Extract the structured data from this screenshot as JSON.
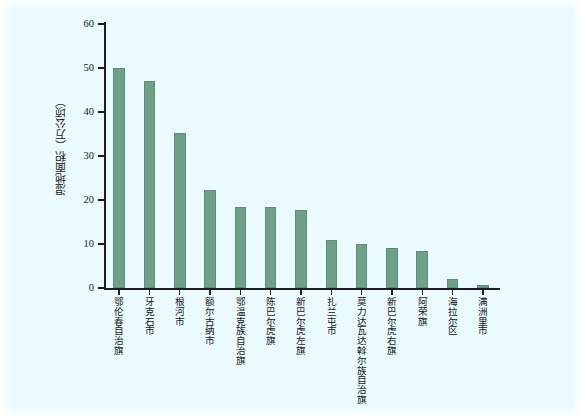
{
  "figure": {
    "background_color": "#eafafd",
    "bar_color": "#6fa188",
    "axis_color": "#1d1d1d"
  },
  "chart_data": {
    "type": "bar",
    "title": "",
    "xlabel": "",
    "ylabel": "湿地面积（万公顷）",
    "ylim": [
      0,
      60
    ],
    "yticks": [
      0,
      10,
      20,
      30,
      40,
      50,
      60
    ],
    "grid": false,
    "legend": null,
    "categories": [
      "鄂伦春自治旗",
      "牙克石市",
      "根河市",
      "额尔古纳市",
      "鄂温克族自治旗",
      "陈巴尔虎旗",
      "新巴尔虎左旗",
      "扎兰屯市",
      "莫力达瓦达斡尔族自治旗",
      "新巴尔虎右旗",
      "阿荣旗",
      "海拉尔区",
      "满洲里市"
    ],
    "values": [
      50.0,
      47.0,
      35.3,
      22.3,
      18.5,
      18.3,
      17.8,
      11.0,
      10.0,
      9.2,
      8.3,
      2.0,
      0.7
    ]
  }
}
